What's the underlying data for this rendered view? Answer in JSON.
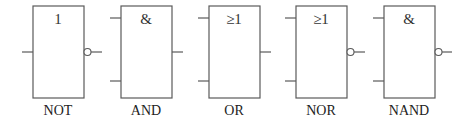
{
  "diagram": {
    "gates": [
      {
        "name": "NOT",
        "symbol": "1",
        "inputs": 1,
        "inverted_output": true,
        "label": "NOT"
      },
      {
        "name": "AND",
        "symbol": "&",
        "inputs": 2,
        "inverted_output": false,
        "label": "AND"
      },
      {
        "name": "OR",
        "symbol": "≥1",
        "inputs": 2,
        "inverted_output": false,
        "label": "OR"
      },
      {
        "name": "NOR",
        "symbol": "≥1",
        "inputs": 2,
        "inverted_output": true,
        "label": "NOR"
      },
      {
        "name": "NAND",
        "symbol": "&",
        "inputs": 2,
        "inverted_output": true,
        "label": "NAND"
      }
    ],
    "colors": {
      "line": "#5a5a5a",
      "text": "#222222",
      "background": "#ffffff"
    }
  }
}
